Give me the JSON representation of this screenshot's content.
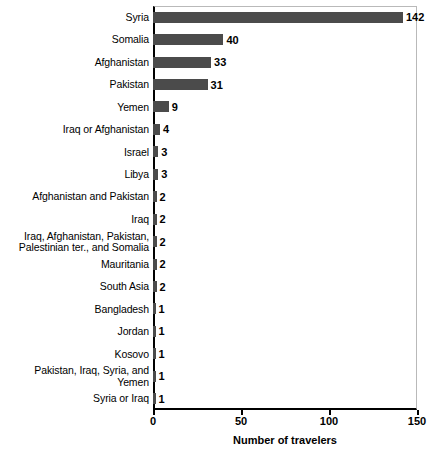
{
  "chart_data": {
    "type": "bar",
    "orientation": "horizontal",
    "title": "",
    "xlabel": "Number of travelers",
    "ylabel": "",
    "xlim": [
      0,
      150
    ],
    "xticks": [
      0,
      50,
      100,
      150
    ],
    "xticklabels": [
      "0",
      "50",
      "100",
      "150"
    ],
    "grid": false,
    "legend": null,
    "bar_color": "#4b4b4b",
    "categories": [
      "Syria",
      "Somalia",
      "Afghanistan",
      "Pakistan",
      "Yemen",
      "Iraq or Afghanistan",
      "Israel",
      "Libya",
      "Afghanistan and Pakistan",
      "Iraq",
      "Iraq, Afghanistan, Pakistan,\nPalestinian ter., and Somalia",
      "Mauritania",
      "South Asia",
      "Bangladesh",
      "Jordan",
      "Kosovo",
      "Pakistan, Iraq, Syria, and\nYemen",
      "Syria or Iraq"
    ],
    "values": [
      142,
      40,
      33,
      31,
      9,
      4,
      3,
      3,
      2,
      2,
      2,
      2,
      2,
      1,
      1,
      1,
      1,
      1
    ],
    "value_labels": [
      "142",
      "40",
      "33",
      "31",
      "9",
      "4",
      "3",
      "3",
      "2",
      "2",
      "2",
      "2",
      "2",
      "1",
      "1",
      "1",
      "1",
      "1"
    ]
  }
}
